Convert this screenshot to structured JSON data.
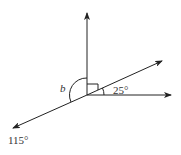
{
  "diagram": {
    "labels": {
      "angle_b": "b",
      "angle_25": "25°",
      "angle_115": "115°"
    },
    "colors": {
      "line": "#222222"
    }
  }
}
